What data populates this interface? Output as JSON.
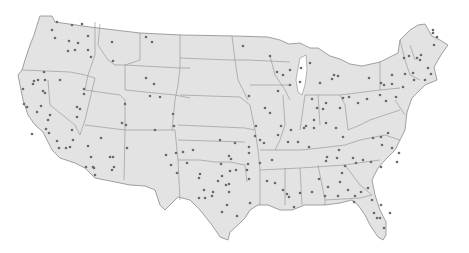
{
  "map": {
    "title": "",
    "region": "Contiguous United States",
    "colors": {
      "background": "#ffffff",
      "land": "#e3e3e3",
      "border": "#8a8a8a",
      "dot": "#6a6a6a"
    },
    "dots": [
      [
        57,
        22
      ],
      [
        72,
        25
      ],
      [
        82,
        24
      ],
      [
        52,
        30
      ],
      [
        55,
        38
      ],
      [
        69,
        41
      ],
      [
        78,
        43
      ],
      [
        88,
        36
      ],
      [
        68,
        51
      ],
      [
        75,
        50
      ],
      [
        88,
        50
      ],
      [
        91,
        57
      ],
      [
        112,
        42
      ],
      [
        146,
        37
      ],
      [
        152,
        42
      ],
      [
        113,
        61
      ],
      [
        44,
        72
      ],
      [
        34,
        81
      ],
      [
        38,
        80
      ],
      [
        45,
        80
      ],
      [
        33,
        84
      ],
      [
        43,
        91
      ],
      [
        45,
        93
      ],
      [
        23,
        89
      ],
      [
        24,
        104
      ],
      [
        27,
        107
      ],
      [
        41,
        106
      ],
      [
        37,
        112
      ],
      [
        50,
        115
      ],
      [
        48,
        120
      ],
      [
        84,
        89
      ],
      [
        84,
        94
      ],
      [
        77,
        107
      ],
      [
        80,
        109
      ],
      [
        77,
        117
      ],
      [
        60,
        80
      ],
      [
        125,
        104
      ],
      [
        126,
        125
      ],
      [
        146,
        78
      ],
      [
        154,
        84
      ],
      [
        150,
        96
      ],
      [
        173,
        114
      ],
      [
        174,
        126
      ],
      [
        160,
        97
      ],
      [
        176,
        153
      ],
      [
        32,
        134
      ],
      [
        46,
        129
      ],
      [
        49,
        133
      ],
      [
        57,
        141
      ],
      [
        59,
        148
      ],
      [
        66,
        148
      ],
      [
        70,
        147
      ],
      [
        73,
        140
      ],
      [
        72,
        130
      ],
      [
        88,
        146
      ],
      [
        91,
        157
      ],
      [
        94,
        168
      ],
      [
        86,
        167
      ],
      [
        93,
        167
      ],
      [
        95,
        175
      ],
      [
        101,
        138
      ],
      [
        110,
        157
      ],
      [
        114,
        167
      ],
      [
        113,
        157
      ],
      [
        127,
        148
      ],
      [
        122,
        123
      ],
      [
        112,
        170
      ],
      [
        155,
        130
      ],
      [
        166,
        155
      ],
      [
        171,
        165
      ],
      [
        177,
        173
      ],
      [
        193,
        150
      ],
      [
        187,
        163
      ],
      [
        200,
        174
      ],
      [
        199,
        178
      ],
      [
        199,
        198
      ],
      [
        205,
        198
      ],
      [
        204,
        190
      ],
      [
        212,
        196
      ],
      [
        213,
        192
      ],
      [
        222,
        176
      ],
      [
        230,
        171
      ],
      [
        218,
        181
      ],
      [
        229,
        184
      ],
      [
        221,
        164
      ],
      [
        229,
        156
      ],
      [
        220,
        140
      ],
      [
        231,
        159
      ],
      [
        236,
        170
      ],
      [
        227,
        205
      ],
      [
        237,
        216
      ],
      [
        250,
        203
      ],
      [
        247,
        170
      ],
      [
        229,
        192
      ],
      [
        235,
        143
      ],
      [
        183,
        152
      ],
      [
        226,
        185
      ],
      [
        222,
        212
      ],
      [
        243,
        46
      ],
      [
        270,
        56
      ],
      [
        277,
        72
      ],
      [
        283,
        75
      ],
      [
        290,
        70
      ],
      [
        278,
        91
      ],
      [
        249,
        96
      ],
      [
        265,
        108
      ],
      [
        270,
        113
      ],
      [
        301,
        68
      ],
      [
        310,
        63
      ],
      [
        290,
        85
      ],
      [
        300,
        82
      ],
      [
        320,
        83
      ],
      [
        334,
        75
      ],
      [
        332,
        79
      ],
      [
        338,
        76
      ],
      [
        312,
        99
      ],
      [
        317,
        108
      ],
      [
        323,
        109
      ],
      [
        326,
        103
      ],
      [
        340,
        108
      ],
      [
        343,
        98
      ],
      [
        349,
        97
      ],
      [
        358,
        103
      ],
      [
        367,
        99
      ],
      [
        380,
        95
      ],
      [
        369,
        78
      ],
      [
        381,
        83
      ],
      [
        384,
        85
      ],
      [
        392,
        84
      ],
      [
        392,
        75
      ],
      [
        405,
        74
      ],
      [
        413,
        73
      ],
      [
        404,
        58
      ],
      [
        409,
        56
      ],
      [
        421,
        55
      ],
      [
        434,
        45
      ],
      [
        437,
        37
      ],
      [
        433,
        33
      ],
      [
        433,
        30
      ],
      [
        417,
        58
      ],
      [
        420,
        60
      ],
      [
        428,
        68
      ],
      [
        431,
        74
      ],
      [
        425,
        80
      ],
      [
        414,
        80
      ],
      [
        403,
        87
      ],
      [
        396,
        97
      ],
      [
        386,
        101
      ],
      [
        260,
        140
      ],
      [
        264,
        143
      ],
      [
        281,
        126
      ],
      [
        272,
        160
      ],
      [
        260,
        163
      ],
      [
        249,
        179
      ],
      [
        267,
        181
      ],
      [
        275,
        183
      ],
      [
        298,
        142
      ],
      [
        309,
        147
      ],
      [
        327,
        157
      ],
      [
        326,
        161
      ],
      [
        337,
        158
      ],
      [
        345,
        166
      ],
      [
        342,
        173
      ],
      [
        340,
        182
      ],
      [
        319,
        179
      ],
      [
        328,
        187
      ],
      [
        312,
        192
      ],
      [
        348,
        190
      ],
      [
        368,
        188
      ],
      [
        361,
        192
      ],
      [
        372,
        200
      ],
      [
        381,
        205
      ],
      [
        377,
        218
      ],
      [
        384,
        228
      ],
      [
        380,
        218
      ],
      [
        390,
        213
      ],
      [
        374,
        213
      ],
      [
        354,
        202
      ],
      [
        355,
        196
      ],
      [
        338,
        196
      ],
      [
        325,
        196
      ],
      [
        283,
        190
      ],
      [
        287,
        194
      ],
      [
        300,
        193
      ],
      [
        294,
        207
      ],
      [
        289,
        197
      ],
      [
        314,
        120
      ],
      [
        326,
        123
      ],
      [
        336,
        128
      ],
      [
        343,
        137
      ],
      [
        339,
        150
      ],
      [
        353,
        158
      ],
      [
        356,
        163
      ],
      [
        363,
        160
      ],
      [
        371,
        162
      ],
      [
        373,
        138
      ],
      [
        388,
        133
      ],
      [
        382,
        145
      ],
      [
        381,
        137
      ],
      [
        392,
        148
      ],
      [
        399,
        153
      ],
      [
        397,
        162
      ],
      [
        381,
        167
      ],
      [
        306,
        126
      ],
      [
        304,
        128
      ],
      [
        314,
        128
      ],
      [
        291,
        130
      ],
      [
        278,
        135
      ],
      [
        288,
        142
      ],
      [
        256,
        126
      ],
      [
        255,
        136
      ],
      [
        249,
        147
      ],
      [
        249,
        153
      ],
      [
        248,
        164
      ]
    ]
  }
}
